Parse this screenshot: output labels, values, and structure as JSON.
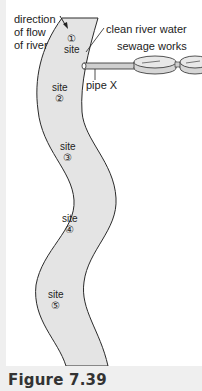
{
  "figure": {
    "caption": "Figure 7.39",
    "labels": {
      "direction": [
        "direction",
        "of flow",
        "of river"
      ],
      "clean_water": "clean river water",
      "sewage_works": "sewage works",
      "pipe": "pipe X"
    },
    "sites": [
      {
        "label": "site",
        "number": "①"
      },
      {
        "label": "site",
        "number": "②"
      },
      {
        "label": "site",
        "number": "③"
      },
      {
        "label": "site",
        "number": "④"
      },
      {
        "label": "site",
        "number": "⑤"
      }
    ],
    "colors": {
      "river_fill": "#e4e4e4",
      "outline": "#2a2a2a",
      "background": "#ffffff",
      "margin": "#efefef"
    }
  }
}
